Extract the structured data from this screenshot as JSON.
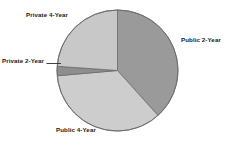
{
  "chart_data": {
    "type": "pie",
    "title": "",
    "subtitle": "",
    "legend_position": "none",
    "grid": false,
    "labels_inline": true,
    "categories": [
      "Public 2-Year",
      "Public 4-Year",
      "Private 2-Year",
      "Private 4-Year"
    ],
    "values": [
      38.3,
      35.3,
      2.5,
      23.9
    ],
    "units": "percent",
    "start_angle_deg": 0,
    "direction": "clockwise",
    "slices": [
      {
        "label": "Public 2-Year",
        "value": 38.3,
        "color": "#9a9a9a",
        "start_angle_deg": 0,
        "end_angle_deg": 138
      },
      {
        "label": "Public 4-Year",
        "value": 35.3,
        "color": "#cdcdcd",
        "start_angle_deg": 138,
        "end_angle_deg": 265
      },
      {
        "label": "Private 2-Year",
        "value": 2.5,
        "color": "#8e8e8e",
        "start_angle_deg": 265,
        "end_angle_deg": 274
      },
      {
        "label": "Private 4-Year",
        "value": 23.9,
        "color": "#c8c8c8",
        "start_angle_deg": 274,
        "end_angle_deg": 360
      }
    ]
  },
  "labels": {
    "private_4_year": "Private 4-Year",
    "public_2_year": "Public 2-Year",
    "private_2_year": "Private 2-Year",
    "public_4_year": "Public 4-Year"
  },
  "colors": {
    "background": "#ffffff",
    "outline": "#6b6b6b",
    "text": "#1a1a1a",
    "leader_line": "#2b2b2b",
    "public_2_year": "#9a9a9a",
    "public_4_year": "#cdcdcd",
    "private_2_year": "#8e8e8e",
    "private_4_year": "#c8c8c8"
  },
  "geometry": {
    "center_x": 117.5,
    "center_y": 70.5,
    "radius": 60.5
  }
}
